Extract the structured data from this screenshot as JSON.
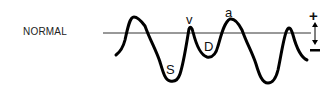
{
  "diagram": {
    "row_label": "NORMAL",
    "waveform_labels": {
      "s": "S",
      "v": "v",
      "d": "D",
      "a": "a"
    },
    "scale": {
      "plus": "+",
      "minus": "−"
    },
    "colors": {
      "trace": "#000000",
      "baseline": "#333333"
    }
  }
}
